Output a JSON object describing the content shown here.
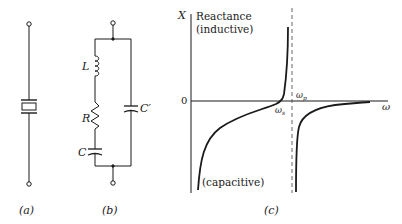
{
  "captions": {
    "a": "(a)",
    "b": "(b)",
    "c": "(c)"
  },
  "circuit_b": {
    "L": "L",
    "R": "R",
    "C": "C",
    "Cp": "C′"
  },
  "graph": {
    "y_axis_label": "X",
    "title_line1": "Reactance",
    "title_line2": "(inductive)",
    "bottom_label": "(capacitive)",
    "zero_label": "0",
    "x_axis_label": "ω",
    "ws_label": "ω",
    "ws_sub": "s",
    "wp_label": "ω",
    "wp_sub": "p"
  },
  "colors": {
    "ink": "#1a1a1a",
    "dashed": "#555555"
  }
}
